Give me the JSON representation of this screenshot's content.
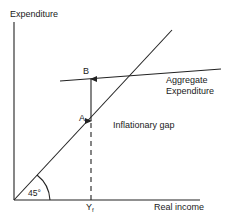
{
  "diagram": {
    "type": "keynesian-cross",
    "y_axis_label": "Expenditure",
    "x_axis_label": "Real income",
    "curves": [
      {
        "name": "45-degree line",
        "label": "",
        "angle_label": "45°"
      },
      {
        "name": "aggregate expenditure",
        "label_line1": "Aggregate",
        "label_line2": "Expenditure"
      }
    ],
    "points": {
      "upper": "B",
      "lower": "A"
    },
    "gap_label": "Inflationary gap",
    "income_marker": "Y",
    "income_marker_sub": "f"
  }
}
